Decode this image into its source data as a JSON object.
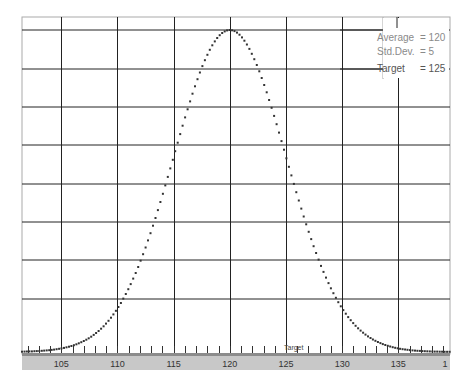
{
  "chart_data": {
    "type": "scatter",
    "title": "",
    "xlabel": "",
    "ylabel": "",
    "distribution": "normal",
    "mean": 120,
    "std_dev": 5,
    "target": 125,
    "xlim": [
      101.5,
      139.6
    ],
    "ylim": [
      0,
      1.05
    ],
    "grid": true,
    "x_ticks": [
      105,
      110,
      115,
      120,
      125,
      130,
      135
    ],
    "x_tick_labels": [
      "105",
      "110",
      "115",
      "120",
      "125",
      "130",
      "135",
      "1"
    ],
    "horizontal_gridlines": 8,
    "legend_position": "top-right",
    "annotations": [
      "Average = 120",
      "Std.Dev. = 5",
      "Target = 125",
      "Target"
    ],
    "series": [
      {
        "name": "Normal curve (dotted)",
        "x_range": [
          101.5,
          139.6
        ],
        "peak_x": 120,
        "peak_y": 1.0
      }
    ]
  },
  "legend": {
    "average_label": "Average",
    "average_value": "= 120",
    "stddev_label": "Std.Dev.",
    "stddev_value": "= 5",
    "target_label": "Target",
    "target_value": "= 125"
  },
  "axis": {
    "labels": [
      "105",
      "110",
      "115",
      "120",
      "125",
      "130",
      "135",
      "1"
    ],
    "target_marker": "Target"
  },
  "colors": {
    "grid": "#222222",
    "border": "#aaaaaa",
    "axis_band": "#c8c8c8",
    "axis_band_dark": "#8c8c8c",
    "curve": "#333333"
  }
}
